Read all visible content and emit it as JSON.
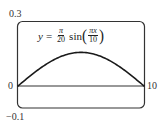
{
  "chart_data": {
    "type": "line",
    "title": "",
    "equation": {
      "lhs": "y",
      "equals": "=",
      "coef_num": "π",
      "coef_den": "20",
      "func": "sin",
      "arg_num": "πx",
      "arg_den": "10",
      "open_paren": "(",
      "close_paren": ")"
    },
    "xlabel": "",
    "ylabel": "",
    "xlim": [
      0,
      10
    ],
    "ylim": [
      -0.1,
      0.3
    ],
    "tick_labels": {
      "y_top": "0.3",
      "y_bottom": "−0.1",
      "x_left": "0",
      "x_right": "10"
    },
    "series": [
      {
        "name": "y = (π/20) sin(πx/10)",
        "x": [
          0,
          1,
          2,
          3,
          4,
          5,
          6,
          7,
          8,
          9,
          10
        ],
        "y": [
          0,
          0.0485,
          0.0923,
          0.1271,
          0.1494,
          0.1571,
          0.1494,
          0.1271,
          0.0923,
          0.0485,
          0
        ]
      }
    ],
    "grid": false,
    "legend": "none",
    "colors": {
      "curve": "#1a1a1a",
      "frame": "#333333",
      "axis": "#333333"
    }
  }
}
